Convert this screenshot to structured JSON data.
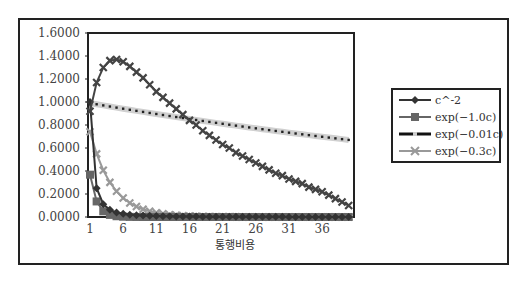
{
  "chart_data": {
    "type": "line",
    "title": "",
    "xlabel": "통행비용",
    "ylabel": "",
    "ylim": [
      0,
      1.6
    ],
    "xlim": [
      1,
      40
    ],
    "grid": false,
    "legend_position": "right",
    "y_ticks": [
      "0.0000",
      "0.2000",
      "0.4000",
      "0.6000",
      "0.8000",
      "1.0000",
      "1.2000",
      "1.4000",
      "1.6000"
    ],
    "x_ticks": [
      "1",
      "6",
      "11",
      "16",
      "21",
      "26",
      "31",
      "36"
    ],
    "x": [
      1,
      2,
      3,
      4,
      5,
      6,
      7,
      8,
      9,
      10,
      11,
      12,
      13,
      14,
      15,
      16,
      17,
      18,
      19,
      20,
      21,
      22,
      23,
      24,
      25,
      26,
      27,
      28,
      29,
      30,
      31,
      32,
      33,
      34,
      35,
      36,
      37,
      38,
      39,
      40
    ],
    "series": [
      {
        "name": "c^-2",
        "marker": "diamond",
        "color": "#333333",
        "values": [
          1.0,
          0.25,
          0.1111,
          0.0625,
          0.04,
          0.0278,
          0.0204,
          0.0156,
          0.0123,
          0.01,
          0.0083,
          0.0069,
          0.0059,
          0.0051,
          0.0044,
          0.0039,
          0.0035,
          0.0031,
          0.0028,
          0.0025,
          0.0023,
          0.0021,
          0.0019,
          0.0017,
          0.0016,
          0.0015,
          0.0014,
          0.0013,
          0.0012,
          0.0011,
          0.001,
          0.001,
          0.0009,
          0.0009,
          0.0008,
          0.0008,
          0.0007,
          0.0007,
          0.0007,
          0.0006
        ]
      },
      {
        "name": "exp(-1.0c)",
        "marker": "square",
        "color": "#666666",
        "values": [
          0.3679,
          0.1353,
          0.0498,
          0.0183,
          0.0067,
          0.0025,
          0.0009,
          0.0003,
          0.0001,
          0.0,
          0,
          0,
          0,
          0,
          0,
          0,
          0,
          0,
          0,
          0,
          0,
          0,
          0,
          0,
          0,
          0,
          0,
          0,
          0,
          0,
          0,
          0,
          0,
          0,
          0,
          0,
          0,
          0,
          0,
          0
        ]
      },
      {
        "name": "exp(-0.01c)",
        "marker": "dot",
        "color": "#222222",
        "marker_color": "#cccccc",
        "values": [
          0.99,
          0.9802,
          0.9704,
          0.9608,
          0.9512,
          0.9418,
          0.9324,
          0.9231,
          0.9139,
          0.9048,
          0.8958,
          0.8869,
          0.8781,
          0.8694,
          0.8607,
          0.8521,
          0.8437,
          0.8353,
          0.827,
          0.8187,
          0.8106,
          0.8025,
          0.7945,
          0.7866,
          0.7788,
          0.7711,
          0.7634,
          0.7558,
          0.7483,
          0.7408,
          0.7334,
          0.7261,
          0.7189,
          0.7118,
          0.7047,
          0.6977,
          0.6907,
          0.6839,
          0.6771,
          0.6703
        ]
      },
      {
        "name": "exp(-0.3c)",
        "marker": "x",
        "color": "#999999",
        "values": [
          0.7408,
          0.5488,
          0.4066,
          0.3012,
          0.2231,
          0.1653,
          0.1225,
          0.0907,
          0.0672,
          0.0498,
          0.0369,
          0.0273,
          0.0202,
          0.015,
          0.0111,
          0.0082,
          0.0061,
          0.0045,
          0.0033,
          0.0025,
          0.0018,
          0.0014,
          0.001,
          0.0007,
          0.0006,
          0.0004,
          0.0003,
          0.0002,
          0.0002,
          0.0001,
          0.0001,
          0,
          0,
          0,
          0,
          0,
          0,
          0,
          0,
          0
        ]
      },
      {
        "name": "(unlabeled hump series)",
        "marker": "x",
        "color": "#444444",
        "values": [
          0.92,
          1.17,
          1.3,
          1.36,
          1.37,
          1.35,
          1.31,
          1.26,
          1.21,
          1.15,
          1.09,
          1.04,
          0.99,
          0.94,
          0.89,
          0.84,
          0.8,
          0.75,
          0.71,
          0.67,
          0.63,
          0.6,
          0.56,
          0.53,
          0.5,
          0.47,
          0.44,
          0.41,
          0.38,
          0.36,
          0.33,
          0.31,
          0.29,
          0.26,
          0.24,
          0.22,
          0.19,
          0.16,
          0.13,
          0.1
        ]
      }
    ]
  },
  "legend": {
    "items": [
      {
        "label": "c^-2",
        "marker": "diamond"
      },
      {
        "label": "exp(−1.0c)",
        "marker": "square"
      },
      {
        "label": "exp(−0.01c)",
        "marker": "dot"
      },
      {
        "label": "exp(−0.3c)",
        "marker": "x"
      }
    ]
  },
  "axis": {
    "xlabel": "통행비용"
  }
}
